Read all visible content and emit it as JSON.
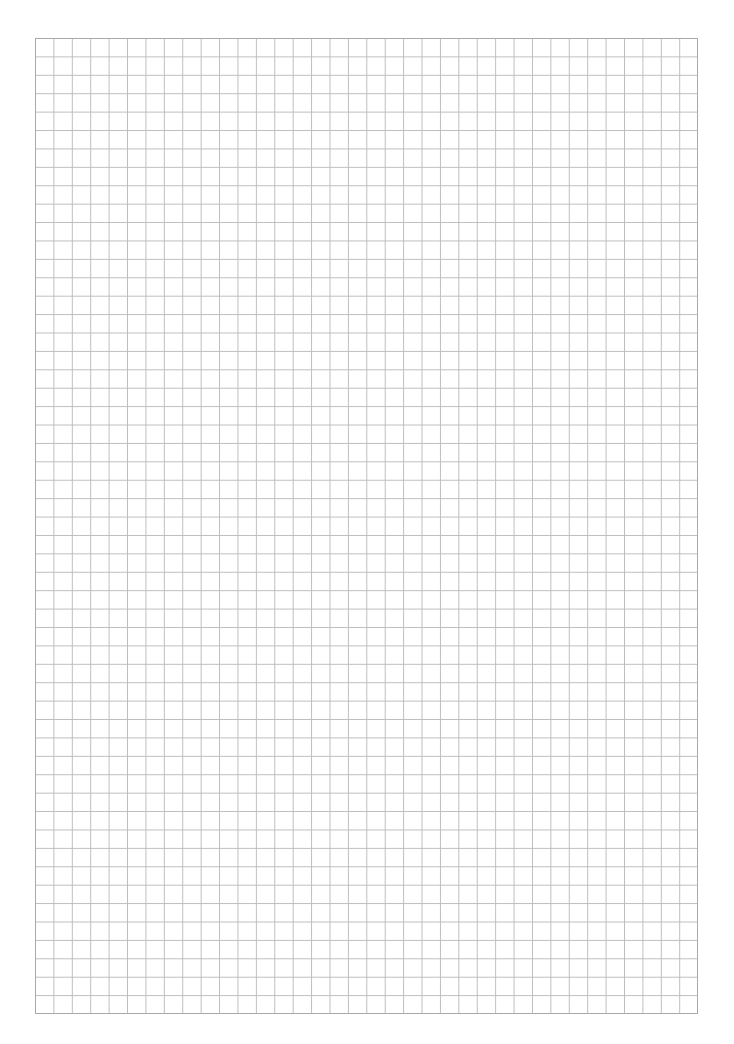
{
  "page": {
    "type": "graph-paper",
    "grid": {
      "columns": 36,
      "rows": 53,
      "line_color": "#bdbdbd",
      "border_color": "#a9a9a9",
      "background": "#ffffff"
    }
  }
}
